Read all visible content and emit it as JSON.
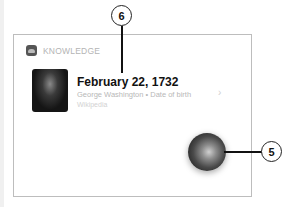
{
  "card": {
    "section_label": "KNOWLEDGE",
    "section_icon": "knowledge-app-icon",
    "result": {
      "title": "February 22, 1732",
      "subtitle": "George Washington • Date of birth",
      "source": "Wikipedia",
      "chevron": "›",
      "thumbnail": "george-washington-portrait"
    }
  },
  "siri_button": {
    "icon": "siri-icon"
  },
  "callouts": [
    {
      "number": "6",
      "target": "result-title"
    },
    {
      "number": "5",
      "target": "siri-button"
    }
  ]
}
